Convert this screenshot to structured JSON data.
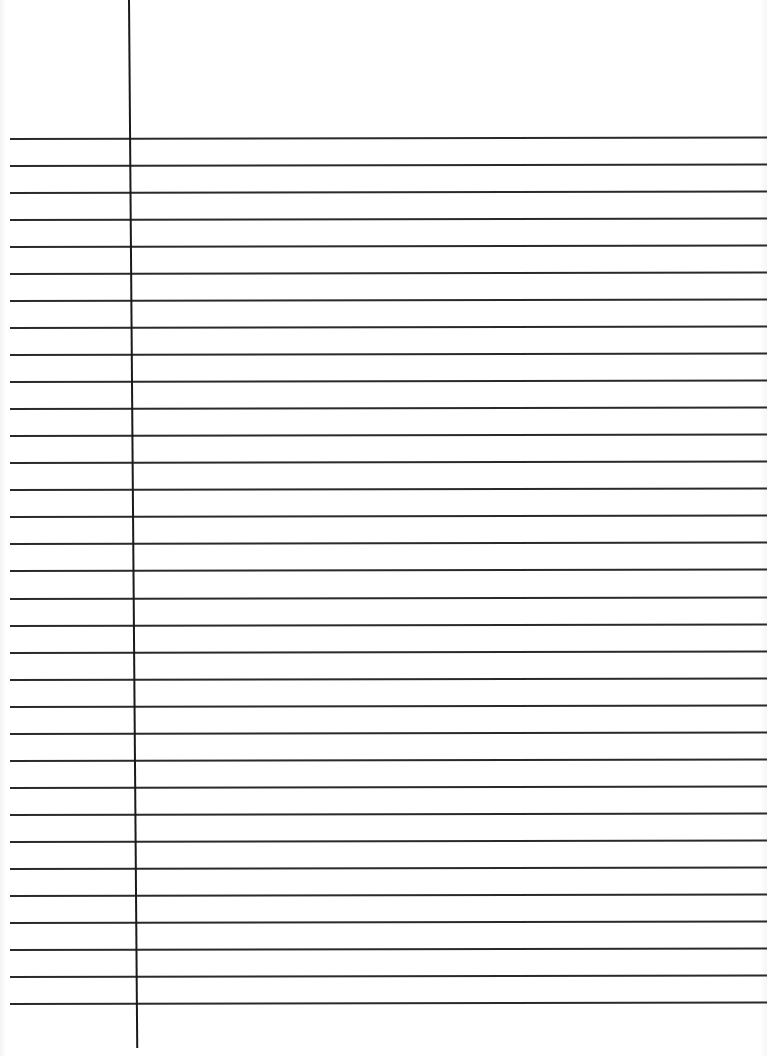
{
  "page": {
    "type": "lined-paper",
    "background_color": "#ffffff",
    "line_color": "#2a2a2a",
    "margin_line_color": "#1a1a1a",
    "rule_count": 33,
    "first_rule_y": 138,
    "rule_spacing": 27.03,
    "margin_x": 128,
    "text": ""
  }
}
